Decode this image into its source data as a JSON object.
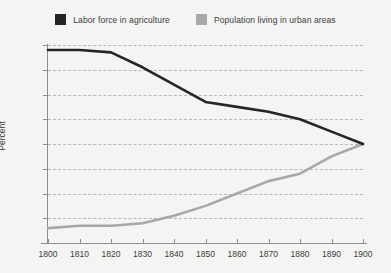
{
  "chart_data": {
    "type": "line",
    "title": "",
    "subtitle": "",
    "xlabel": "",
    "ylabel": "Percent",
    "x": [
      1800,
      1810,
      1820,
      1830,
      1840,
      1850,
      1860,
      1870,
      1880,
      1890,
      1900
    ],
    "xlim": [
      1800,
      1900
    ],
    "ylim": [
      0,
      80
    ],
    "grid": true,
    "grid_style": "dashed-horizontal",
    "legend_position": "top-center",
    "xticks": [
      "1800",
      "1810",
      "1820",
      "1830",
      "1840",
      "1850",
      "1860",
      "1870",
      "1880",
      "1890",
      "1900"
    ],
    "yticks": [
      "0",
      "10",
      "20",
      "30",
      "40",
      "50",
      "60",
      "70",
      "80"
    ],
    "series": [
      {
        "name": "Labor force in agriculture",
        "color": "#252525",
        "values": [
          78,
          78,
          77,
          71,
          64,
          57,
          55,
          53,
          50,
          45,
          40
        ]
      },
      {
        "name": "Population living in urban areas",
        "color": "#a8a8a8",
        "values": [
          6,
          7,
          7,
          8,
          11,
          15,
          20,
          25,
          28,
          35,
          40
        ]
      }
    ]
  },
  "legend": {
    "items": [
      {
        "label": "Labor force in agriculture",
        "swatch": "legend-swatch-dark",
        "color": "#252525"
      },
      {
        "label": "Population living in urban areas",
        "swatch": "legend-swatch-gray",
        "color": "#a8a8a8"
      }
    ]
  },
  "axes": {
    "y_title": "Percent"
  },
  "colors": {
    "background": "#f4f4f2",
    "axis": "#8d8d8d",
    "grid": "#b8b8b8",
    "text": "#3b3b3b",
    "series_dark": "#252525",
    "series_gray": "#a8a8a8"
  }
}
